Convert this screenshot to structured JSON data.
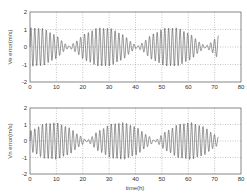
{
  "chart_data": [
    {
      "type": "line",
      "title": "",
      "xlabel": "",
      "ylabel": "Ve error(m/s)",
      "xlim": [
        0,
        80
      ],
      "ylim": [
        -2,
        2
      ],
      "xticks": [
        0,
        10,
        20,
        30,
        40,
        50,
        60,
        70,
        80
      ],
      "yticks": [
        -2,
        -1,
        0,
        1,
        2
      ],
      "grid": true,
      "grid_style": "dotted",
      "legend": null,
      "series": [
        {
          "name": "Ve error",
          "description": "Amplitude-modulated oscillation (beat pattern), amplitude ~1.1 m/s at envelope peaks, near 0 at nodes",
          "t_end": 71.5,
          "carrier_period_h": 1.45,
          "envelope_period_h": 25.8,
          "envelope_peaks_h": [
            2,
            14,
            27,
            40,
            53,
            66
          ],
          "envelope_nodes_h": [
            8,
            21,
            34,
            47,
            60
          ],
          "amplitude": 1.1,
          "envelope_phase_h": 2
        }
      ]
    },
    {
      "type": "line",
      "title": "",
      "xlabel": "time(h)",
      "ylabel": "Vn error(m/s)",
      "xlim": [
        0,
        80
      ],
      "ylim": [
        -2,
        2
      ],
      "xticks": [
        0,
        10,
        20,
        30,
        40,
        50,
        60,
        70,
        80
      ],
      "yticks": [
        -2,
        -1,
        0,
        1,
        2
      ],
      "grid": true,
      "grid_style": "dotted",
      "legend": null,
      "series": [
        {
          "name": "Vn error",
          "description": "Amplitude-modulated oscillation (beat pattern), amplitude ~1.1 m/s at envelope peaks, near 0 at nodes",
          "t_end": 71.5,
          "carrier_period_h": 1.45,
          "envelope_period_h": 25.8,
          "envelope_peaks_h": [
            7.5,
            21,
            34,
            47,
            60
          ],
          "envelope_nodes_h": [
            1,
            14,
            27,
            40,
            53,
            66
          ],
          "amplitude": 1.1,
          "envelope_phase_h": 8.45
        }
      ]
    }
  ],
  "plots": [
    {
      "ylabel": "Ve error(m/s)",
      "xlabel": ""
    },
    {
      "ylabel": "Vn error(m/s)",
      "xlabel": "time(h)"
    }
  ],
  "colors": {
    "line": "#444444",
    "axes": "#555555",
    "grid": "#888888"
  }
}
